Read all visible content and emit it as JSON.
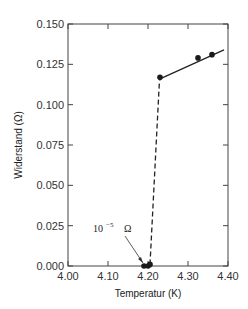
{
  "chart_data": {
    "type": "scatter",
    "title": "",
    "xlabel": "Temperatur (K)",
    "ylabel": "Widerstand (Ω)",
    "xlim": [
      4.0,
      4.4
    ],
    "ylim": [
      0.0,
      0.15
    ],
    "x_ticks": [
      "4.00",
      "4.10",
      "4.20",
      "4.30",
      "4.40"
    ],
    "y_ticks": [
      "0.000",
      "0.025",
      "0.050",
      "0.075",
      "0.100",
      "0.125",
      "0.150"
    ],
    "grid": false,
    "series": [
      {
        "name": "Messpunkte",
        "style": "markers",
        "points": [
          {
            "x": 4.19,
            "y": 0.0
          },
          {
            "x": 4.2,
            "y": 0.0
          },
          {
            "x": 4.205,
            "y": 0.001
          },
          {
            "x": 4.23,
            "y": 0.117
          },
          {
            "x": 4.325,
            "y": 0.129
          },
          {
            "x": 4.36,
            "y": 0.131
          }
        ]
      },
      {
        "name": "Normalleitender Bereich (Fit)",
        "style": "solid-line",
        "points": [
          {
            "x": 4.23,
            "y": 0.116
          },
          {
            "x": 4.39,
            "y": 0.134
          }
        ]
      },
      {
        "name": "Sprungübergang",
        "style": "dashed-line",
        "points": [
          {
            "x": 4.205,
            "y": 0.001
          },
          {
            "x": 4.228,
            "y": 0.112
          },
          {
            "x": 4.23,
            "y": 0.116
          }
        ]
      }
    ],
    "annotations": [
      {
        "text_base": "10",
        "text_exp": "−5",
        "text_unit": "Ω",
        "arrow_to": {
          "x": 4.19,
          "y": 0.001
        }
      }
    ],
    "legend": null
  }
}
